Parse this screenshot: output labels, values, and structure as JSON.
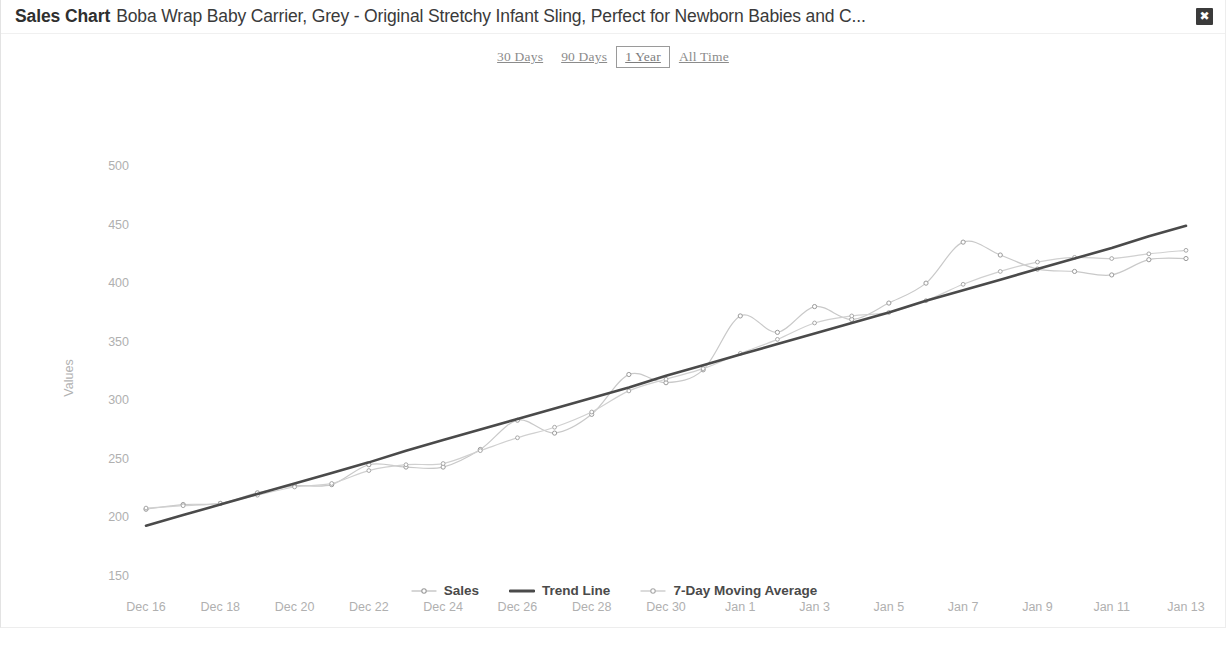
{
  "header": {
    "title": "Sales Chart",
    "subtitle": "Boba Wrap Baby Carrier, Grey - Original Stretchy Infant Sling, Perfect for Newborn Babies and C...",
    "close_label": "✖",
    "close_icon": "close-icon"
  },
  "range_tabs": [
    {
      "label": "30 Days",
      "active": false
    },
    {
      "label": "90 Days",
      "active": false
    },
    {
      "label": "1 Year",
      "active": true
    },
    {
      "label": "All Time",
      "active": false
    }
  ],
  "colors": {
    "sales_line": "#c9c9c9",
    "sales_marker": "#9a9a9a",
    "trend_line": "#4a4a4a",
    "moving_average_line": "#d0d0d0",
    "moving_average_marker": "#a8a8a8",
    "axis_text": "#b0b0b0",
    "close_button_bg": "#3b3b3b",
    "tab_text": "#8b8b8b"
  },
  "chart_data": {
    "type": "line",
    "title": "Sales Chart",
    "xlabel": "",
    "ylabel": "Values",
    "ylim": [
      150,
      500
    ],
    "yticks": [
      150,
      200,
      250,
      300,
      350,
      400,
      450,
      500
    ],
    "grid": false,
    "legend_position": "bottom",
    "x": [
      "Dec 16",
      "Dec 17",
      "Dec 18",
      "Dec 19",
      "Dec 20",
      "Dec 21",
      "Dec 22",
      "Dec 23",
      "Dec 24",
      "Dec 25",
      "Dec 26",
      "Dec 27",
      "Dec 28",
      "Dec 29",
      "Dec 30",
      "Dec 31",
      "Jan 1",
      "Jan 2",
      "Jan 3",
      "Jan 4",
      "Jan 5",
      "Jan 6",
      "Jan 7",
      "Jan 8",
      "Jan 9",
      "Jan 10",
      "Jan 11",
      "Jan 12",
      "Jan 13"
    ],
    "xticks": [
      "Dec 16",
      "Dec 18",
      "Dec 20",
      "Dec 22",
      "Dec 24",
      "Dec 26",
      "Dec 28",
      "Dec 30",
      "Jan 1",
      "Jan 3",
      "Jan 5",
      "Jan 7",
      "Jan 9",
      "Jan 11",
      "Jan 13"
    ],
    "series": [
      {
        "name": "Sales",
        "style": "line-markers",
        "values": [
          207,
          211,
          212,
          221,
          227,
          228,
          245,
          243,
          243,
          258,
          283,
          272,
          288,
          322,
          315,
          326,
          372,
          358,
          380,
          369,
          383,
          400,
          435,
          424,
          412,
          410,
          407,
          420,
          421
        ]
      },
      {
        "name": "Trend Line",
        "style": "line",
        "values": [
          193,
          202,
          211,
          220,
          229,
          238,
          247,
          257,
          266,
          275,
          284,
          293,
          302,
          311,
          321,
          330,
          339,
          348,
          357,
          366,
          375,
          385,
          394,
          403,
          412,
          421,
          430,
          440,
          449
        ]
      },
      {
        "name": "7-Day Moving Average",
        "style": "line-markers",
        "values": [
          208,
          210,
          212,
          219,
          226,
          229,
          240,
          245,
          246,
          257,
          268,
          277,
          290,
          308,
          318,
          327,
          340,
          352,
          366,
          372,
          375,
          385,
          399,
          410,
          418,
          422,
          421,
          425,
          428
        ]
      }
    ]
  }
}
